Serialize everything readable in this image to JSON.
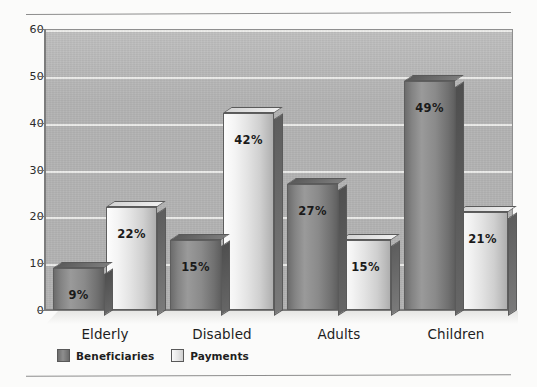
{
  "chart_data": {
    "type": "bar",
    "title": "",
    "subtitle": "",
    "xlabel": "",
    "ylabel": "",
    "categories": [
      "Elderly",
      "Disabled",
      "Adults",
      "Children"
    ],
    "series": [
      {
        "name": "Beneficiaries",
        "color": "#8a8a8a",
        "values": [
          9,
          15,
          27,
          49
        ],
        "labels": [
          "9%",
          "15%",
          "27%",
          "49%"
        ]
      },
      {
        "name": "Payments",
        "color": "#e6e6e6",
        "values": [
          22,
          42,
          15,
          21
        ],
        "labels": [
          "22%",
          "42%",
          "15%",
          "21%"
        ]
      }
    ],
    "ylim": [
      0,
      60
    ],
    "yticks": [
      0,
      10,
      20,
      30,
      40,
      50,
      60
    ],
    "ytick_labels": [
      "0",
      "10",
      "20",
      "30",
      "40",
      "50",
      "60"
    ],
    "grid": true,
    "grid_orientation": "horizontal",
    "legend_position": "bottom-left",
    "style": "3d-bar",
    "plot_background": "#b2b2b2",
    "gridline_color": "#f0f0ee",
    "axis_color": "#7c7c7c",
    "value_label_color": "#1a1a1a"
  },
  "legend": {
    "items": [
      {
        "label": "Beneficiaries",
        "swatch": "dark"
      },
      {
        "label": "Payments",
        "swatch": "light"
      }
    ]
  },
  "decor": {
    "rule_top": "horizontal-rule",
    "rule_bottom": "horizontal-rule"
  }
}
